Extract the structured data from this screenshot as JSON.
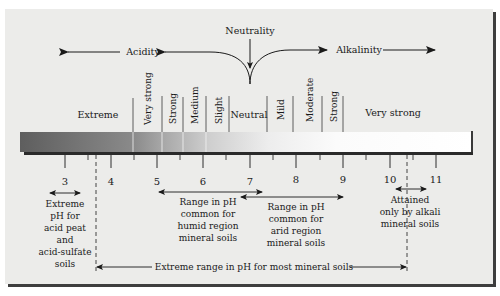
{
  "diagram": {
    "title_center": "Neutrality",
    "direction_left": "Acidity",
    "direction_right": "Alkalinity",
    "scale": {
      "min": 3,
      "max": 11,
      "ticks": [
        "3",
        "4",
        "5",
        "6",
        "7",
        "8",
        "9",
        "10",
        "11"
      ]
    },
    "categories": [
      {
        "label": "Extreme",
        "vertical": false
      },
      {
        "label": "Very strong",
        "vertical": true
      },
      {
        "label": "Strong",
        "vertical": true
      },
      {
        "label": "Medium",
        "vertical": true
      },
      {
        "label": "Slight",
        "vertical": true
      },
      {
        "label": "Neutral",
        "vertical": false
      },
      {
        "label": "Mild",
        "vertical": true
      },
      {
        "label": "Moderate",
        "vertical": true
      },
      {
        "label": "Strong",
        "vertical": true
      },
      {
        "label": "Very strong",
        "vertical": false
      }
    ],
    "annotations": {
      "acid_peat": [
        "Extreme",
        "pH for",
        "acid peat",
        "and",
        "acid-sulfate",
        "soils"
      ],
      "humid": [
        "Range in pH",
        "common for",
        "humid region",
        "mineral soils"
      ],
      "arid": [
        "Range in pH",
        "common for",
        "arid region",
        "mineral soils"
      ],
      "alkali": [
        "Attained",
        "only by alkali",
        "mineral soils"
      ],
      "extreme_range": "Extreme range in pH for most mineral soils"
    },
    "colors": {
      "panel": "#ececea",
      "shadow": "#3e3e3e",
      "bar_dark": "#6a6a6a",
      "bar_light": "#ffffff",
      "ink": "#1a1a1a"
    }
  }
}
